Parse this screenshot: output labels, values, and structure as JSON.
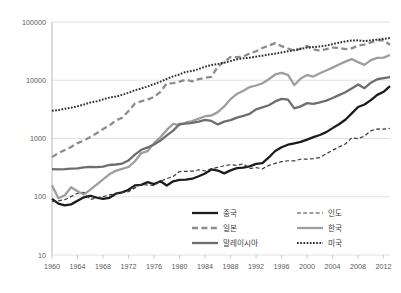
{
  "chart_data": {
    "type": "line",
    "title": "",
    "subtitle": "",
    "xlabel": "",
    "ylabel": "",
    "yscale": "log",
    "ylim": [
      10,
      100000
    ],
    "xlim": [
      1960,
      2013
    ],
    "grid": true,
    "ytick_labels": [
      "100000",
      "10000",
      "1000",
      "100",
      "10"
    ],
    "ytick_values": [
      100000,
      10000,
      1000,
      100,
      10
    ],
    "xtick_labels": [
      "1960",
      "1964",
      "1968",
      "1972",
      "1976",
      "1980",
      "1984",
      "1988",
      "1992",
      "1996",
      "2000",
      "2004",
      "2008",
      "2012"
    ],
    "xtick_values": [
      1960,
      1964,
      1968,
      1972,
      1976,
      1980,
      1984,
      1988,
      1992,
      1996,
      2000,
      2004,
      2008,
      2012
    ],
    "legend_position": "bottom-center",
    "x": [
      1960,
      1961,
      1962,
      1963,
      1964,
      1965,
      1966,
      1967,
      1968,
      1969,
      1970,
      1971,
      1972,
      1973,
      1974,
      1975,
      1976,
      1977,
      1978,
      1979,
      1980,
      1981,
      1982,
      1983,
      1984,
      1985,
      1986,
      1987,
      1988,
      1989,
      1990,
      1991,
      1992,
      1993,
      1994,
      1995,
      1996,
      1997,
      1998,
      1999,
      2000,
      2001,
      2002,
      2003,
      2004,
      2005,
      2006,
      2007,
      2008,
      2009,
      2010,
      2011,
      2012,
      2013
    ],
    "series": [
      {
        "name": "중국",
        "style": "solid",
        "color": "#1c1c1c",
        "width": 2.3,
        "values": [
          92,
          76,
          71,
          74,
          85,
          98,
          104,
          97,
          92,
          96,
          113,
          119,
          132,
          157,
          160,
          178,
          165,
          185,
          156,
          184,
          195,
          197,
          204,
          225,
          251,
          294,
          282,
          252,
          284,
          311,
          317,
          333,
          366,
          377,
          473,
          610,
          709,
          782,
          828,
          873,
          959,
          1053,
          1148,
          1288,
          1508,
          1753,
          2099,
          2694,
          3468,
          3832,
          4550,
          5618,
          6337,
          7900
        ]
      },
      {
        "name": "인도",
        "style": "dotted-dash",
        "color": "#3a3a3a",
        "width": 1.2,
        "values": [
          82,
          85,
          89,
          101,
          115,
          119,
          90,
          96,
          100,
          108,
          112,
          119,
          122,
          142,
          163,
          159,
          156,
          185,
          205,
          223,
          271,
          273,
          275,
          291,
          277,
          304,
          319,
          341,
          355,
          346,
          368,
          304,
          317,
          301,
          346,
          374,
          400,
          415,
          413,
          441,
          443,
          452,
          471,
          547,
          627,
          714,
          806,
          1028,
          993,
          1101,
          1358,
          1458,
          1444,
          1498
        ]
      },
      {
        "name": "일본",
        "style": "dashed",
        "color": "#8c8c8c",
        "width": 2.3,
        "values": [
          479,
          563,
          633,
          717,
          835,
          919,
          1058,
          1230,
          1450,
          1669,
          2038,
          2272,
          2967,
          3975,
          4354,
          4659,
          5197,
          6336,
          8822,
          8903,
          9465,
          10212,
          9576,
          10427,
          10985,
          11465,
          17112,
          20748,
          25059,
          24833,
          25359,
          28915,
          31462,
          35766,
          39269,
          43440,
          38437,
          35022,
          31902,
          35022,
          38532,
          33846,
          32289,
          34082,
          36442,
          35781,
          34102,
          35275,
          39339,
          40855,
          44508,
          48168,
          48603,
          40454
        ]
      },
      {
        "name": "한국",
        "style": "solid",
        "color": "#9e9e9e",
        "width": 2.3,
        "values": [
          158,
          94,
          106,
          146,
          124,
          109,
          133,
          161,
          198,
          243,
          279,
          301,
          324,
          407,
          563,
          608,
          833,
          1048,
          1406,
          1784,
          1704,
          1883,
          1983,
          2199,
          2413,
          2482,
          2835,
          3555,
          4749,
          5818,
          6610,
          7637,
          8127,
          8885,
          10385,
          12565,
          13404,
          12404,
          8282,
          10672,
          12257,
          11561,
          13165,
          14673,
          16496,
          18658,
          20917,
          23101,
          20475,
          18339,
          22151,
          24156,
          24454,
          27103
        ]
      },
      {
        "name": "말레이시아",
        "style": "solid",
        "color": "#6e6e6e",
        "width": 2.3,
        "values": [
          299,
          294,
          297,
          304,
          308,
          319,
          325,
          323,
          330,
          351,
          358,
          371,
          420,
          528,
          640,
          702,
          791,
          920,
          1130,
          1366,
          1775,
          1807,
          1851,
          1945,
          2091,
          2000,
          1746,
          1944,
          2065,
          2285,
          2442,
          2654,
          3165,
          3428,
          3724,
          4330,
          4798,
          4638,
          3284,
          3560,
          4045,
          3914,
          4166,
          4462,
          4951,
          5563,
          6218,
          7243,
          8475,
          7292,
          9069,
          10405,
          10835,
          11308
        ]
      },
      {
        "name": "미국",
        "style": "dotted",
        "color": "#2e2e2e",
        "width": 2.0,
        "values": [
          3007,
          3067,
          3244,
          3375,
          3574,
          3828,
          4146,
          4336,
          4696,
          5032,
          5234,
          5609,
          6094,
          6726,
          7226,
          7801,
          8592,
          9453,
          10565,
          11674,
          12575,
          13976,
          14434,
          15544,
          17121,
          18237,
          19071,
          20039,
          21417,
          22857,
          23889,
          24342,
          25419,
          26387,
          27695,
          28691,
          29968,
          31459,
          32854,
          34515,
          36335,
          37133,
          38023,
          39496,
          41713,
          44115,
          46299,
          47976,
          48383,
          47100,
          48374,
          49781,
          51457,
          52980
        ]
      }
    ]
  },
  "legend": {
    "entries": [
      {
        "label": "중국",
        "col": 0,
        "swatch": "solid-thick-black"
      },
      {
        "label": "일본",
        "col": 0,
        "swatch": "dashed-gray"
      },
      {
        "label": "말레이시아",
        "col": 0,
        "swatch": "solid-gray"
      },
      {
        "label": "인도",
        "col": 1,
        "swatch": "dashed-thin-dark"
      },
      {
        "label": "한국",
        "col": 1,
        "swatch": "solid-lightgray"
      },
      {
        "label": "미국",
        "col": 1,
        "swatch": "dotted-dark"
      }
    ]
  }
}
